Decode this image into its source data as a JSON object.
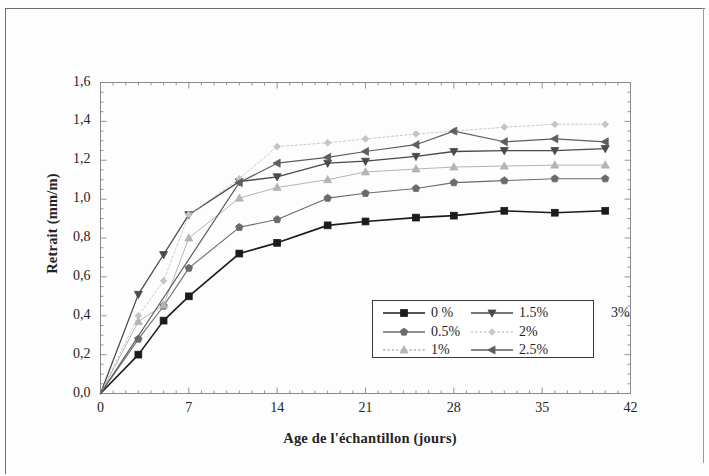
{
  "figure": {
    "type": "scanned-figure",
    "background": "#fdfdfd"
  },
  "chart_data": {
    "type": "line",
    "title": "",
    "xlabel": "Age de l'échantillon (jours)",
    "ylabel": "Retrait (mm/m)",
    "xlim": [
      0,
      42
    ],
    "ylim": [
      0.0,
      1.6
    ],
    "xticks": [
      "0",
      "7",
      "14",
      "21",
      "28",
      "35",
      "42"
    ],
    "xtick_values": [
      0,
      7,
      14,
      21,
      28,
      35,
      42
    ],
    "yticks": [
      "0,0",
      "0,2",
      "0,4",
      "0,6",
      "0,8",
      "1,0",
      "1,2",
      "1,4",
      "1,6"
    ],
    "ytick_values": [
      0.0,
      0.2,
      0.4,
      0.6,
      0.8,
      1.0,
      1.2,
      1.4,
      1.6
    ],
    "grid": false,
    "legend_position": "lower right",
    "minor_ticks": true,
    "series": [
      {
        "name": "0 %",
        "marker": "square",
        "color": "#1b1b1b",
        "linewidth": 1.6,
        "dash": "solid",
        "x": [
          0,
          3,
          5,
          7,
          11,
          14,
          18,
          21,
          25,
          28,
          32,
          36,
          40
        ],
        "y": [
          0.0,
          0.2,
          0.375,
          0.5,
          0.72,
          0.775,
          0.865,
          0.885,
          0.905,
          0.915,
          0.94,
          0.93,
          0.94
        ]
      },
      {
        "name": "0.5%",
        "marker": "pentagon",
        "color": "#6b6b6b",
        "linewidth": 1.1,
        "dash": "solid",
        "x": [
          0,
          3,
          5,
          7,
          11,
          14,
          18,
          21,
          25,
          28,
          32,
          36,
          40
        ],
        "y": [
          0.0,
          0.28,
          0.45,
          0.645,
          0.855,
          0.895,
          1.005,
          1.03,
          1.055,
          1.085,
          1.095,
          1.105,
          1.105
        ]
      },
      {
        "name": "1%",
        "marker": "triangle-up",
        "color": "#b4b4b4",
        "linewidth": 1.0,
        "dash": "solid",
        "x": [
          0,
          3,
          5,
          7,
          11,
          14,
          18,
          21,
          25,
          28,
          32,
          36,
          40
        ],
        "y": [
          0.0,
          0.37,
          0.455,
          0.8,
          1.005,
          1.06,
          1.1,
          1.14,
          1.155,
          1.165,
          1.17,
          1.175,
          1.175
        ]
      },
      {
        "name": "1.5%",
        "marker": "triangle-down",
        "color": "#4a4a4a",
        "linewidth": 1.3,
        "dash": "solid",
        "x": [
          0,
          3,
          5,
          7,
          11,
          14,
          18,
          21,
          25,
          28,
          32,
          36,
          40
        ],
        "y": [
          0.0,
          0.51,
          0.715,
          0.92,
          1.09,
          1.115,
          1.185,
          1.195,
          1.22,
          1.245,
          1.25,
          1.25,
          1.26
        ]
      },
      {
        "name": "2%",
        "marker": "diamond",
        "color": "#c4c4c4",
        "linewidth": 0.9,
        "dash": "dotted",
        "x": [
          0,
          3,
          5,
          7,
          11,
          14,
          18,
          21,
          25,
          28,
          32,
          36,
          40
        ],
        "y": [
          0.0,
          0.4,
          0.58,
          0.92,
          1.105,
          1.27,
          1.29,
          1.31,
          1.335,
          1.35,
          1.37,
          1.385,
          1.385
        ]
      },
      {
        "name": "2.5%",
        "marker": "triangle-left",
        "color": "#5e5e5e",
        "linewidth": 1.2,
        "dash": "solid",
        "x": [
          0,
          11,
          14,
          18,
          21,
          25,
          28,
          32,
          36,
          40
        ],
        "y": [
          0.0,
          1.085,
          1.185,
          1.215,
          1.245,
          1.28,
          1.35,
          1.295,
          1.31,
          1.295
        ]
      },
      {
        "name": "3%",
        "marker": "none",
        "color": "#bdbdbd",
        "linewidth": 0.0,
        "dash": "none",
        "x": [],
        "y": []
      }
    ]
  },
  "legend": {
    "entries": [
      {
        "label": "0 %",
        "marker": "square",
        "color": "#1b1b1b",
        "dash": "solid",
        "has_line": true
      },
      {
        "label": "1.5%",
        "marker": "triangle-down",
        "color": "#4a4a4a",
        "dash": "solid",
        "has_line": true
      },
      {
        "label": "3%",
        "marker": "none",
        "color": "#bdbdbd",
        "dash": "none",
        "has_line": false
      },
      {
        "label": "0.5%",
        "marker": "pentagon",
        "color": "#6b6b6b",
        "dash": "solid",
        "has_line": true
      },
      {
        "label": "2%",
        "marker": "diamond",
        "color": "#c9c9c9",
        "dash": "dotted",
        "has_line": true
      },
      {
        "label": "1%",
        "marker": "triangle-up",
        "color": "#b4b4b4",
        "dash": "dotted",
        "has_line": true
      },
      {
        "label": "2.5%",
        "marker": "triangle-left",
        "color": "#5e5e5e",
        "dash": "solid",
        "has_line": true
      }
    ]
  },
  "axes": {
    "frame_color": "#8a8a8a",
    "text_color": "#242424"
  }
}
